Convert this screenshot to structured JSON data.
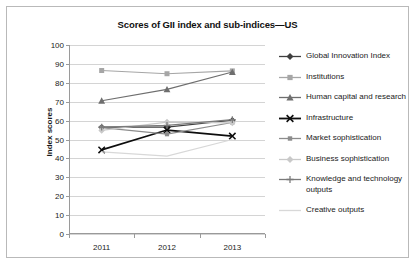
{
  "chart_data": {
    "type": "line",
    "title": "Scores of GII index and sub-indices—US",
    "xlabel": "",
    "ylabel": "Index scores",
    "categories": [
      "2011",
      "2012",
      "2013"
    ],
    "ylim": [
      0,
      100
    ],
    "yticks": [
      0,
      10,
      20,
      30,
      40,
      50,
      60,
      70,
      80,
      90,
      100
    ],
    "grid": true,
    "legend_position": "right",
    "series": [
      {
        "name": "Global Innovation Index",
        "values": [
          56.5,
          56.5,
          60.2
        ],
        "color": "#3f3f3f",
        "marker": "diamond"
      },
      {
        "name": "Institutions",
        "values": [
          86.5,
          84.8,
          86.3
        ],
        "color": "#a6a6a6",
        "marker": "square"
      },
      {
        "name": "Human capital and research",
        "values": [
          70.5,
          76.5,
          85.7
        ],
        "color": "#6e6e6e",
        "marker": "triangle"
      },
      {
        "name": "Infrastructure",
        "values": [
          44.5,
          55.0,
          51.8
        ],
        "color": "#0d0d0d",
        "marker": "x"
      },
      {
        "name": "Market sophistication",
        "values": [
          56.3,
          52.8,
          59.0
        ],
        "color": "#8c8c8c",
        "marker": "square-small"
      },
      {
        "name": "Business sophistication",
        "values": [
          54.8,
          59.2,
          58.8
        ],
        "color": "#c9c9c9",
        "marker": "diamond-light"
      },
      {
        "name": "Knowledge and technology outputs",
        "values": [
          56.5,
          57.5,
          60.5
        ],
        "color": "#7a7a7a",
        "marker": "plus"
      },
      {
        "name": "Creative outputs",
        "values": [
          43.5,
          41.2,
          50.0
        ],
        "color": "#d8d8d8",
        "marker": "none"
      }
    ]
  }
}
